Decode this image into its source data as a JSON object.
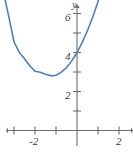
{
  "chart_data": {
    "type": "line",
    "title": "",
    "subtitle": "",
    "xlabel": "",
    "ylabel": "y",
    "axis_names": {
      "x": "",
      "y": "y"
    },
    "xlim": [
      -3.7,
      2.6
    ],
    "ylim": [
      -1.0,
      6.9
    ],
    "grid": false,
    "legend": null,
    "annotations": [],
    "xticks": [
      -3,
      -2,
      -1,
      0,
      1,
      2
    ],
    "xtick_labels": [
      "",
      "-2",
      "",
      "",
      "",
      "2"
    ],
    "yticks": [
      1,
      2,
      3,
      4,
      5,
      6
    ],
    "ytick_labels": [
      "",
      "2",
      "",
      "4",
      "",
      "6"
    ],
    "curve": {
      "name": "parabola",
      "color": "#4a7fc1",
      "linewidth": 1.6,
      "vertex": [
        -1.2,
        2.8
      ],
      "y_intercept": 4.0,
      "opens": "up",
      "equation_form": "y = a(x - h)^2 + k",
      "coefficients": {
        "a": 0.85,
        "h": -1.2,
        "k": 2.8
      },
      "points": [
        [
          -3.7,
          8.13
        ],
        [
          -3.5,
          7.08
        ],
        [
          -3.25,
          5.85
        ],
        [
          -3.0,
          4.55
        ],
        [
          -2.75,
          4.01
        ],
        [
          -2.5,
          3.68
        ],
        [
          -2.25,
          3.32
        ],
        [
          -2.0,
          3.04
        ],
        [
          -1.75,
          2.99
        ],
        [
          -1.5,
          2.88
        ],
        [
          -1.2,
          2.8
        ],
        [
          -1.0,
          2.83
        ],
        [
          -0.75,
          2.99
        ],
        [
          -0.5,
          3.22
        ],
        [
          -0.25,
          3.57
        ],
        [
          0.0,
          4.0
        ],
        [
          0.25,
          4.52
        ],
        [
          0.5,
          5.13
        ],
        [
          0.75,
          5.82
        ],
        [
          1.0,
          6.6
        ],
        [
          1.15,
          7.1
        ]
      ]
    },
    "axes_color": "#6d6d6d",
    "background": "#ffffff",
    "geometry": {
      "origin_px": [
        77,
        130.5
      ],
      "x_unit_px": 21.0,
      "y_unit_px": 19.5,
      "x_axis_y_px": 130.5,
      "y_axis_x_px": 77
    }
  },
  "labels": {
    "y_axis_name": "y",
    "y_6": "6",
    "y_4": "4",
    "y_2": "2",
    "x_neg2": "-2",
    "x_2": "2"
  }
}
